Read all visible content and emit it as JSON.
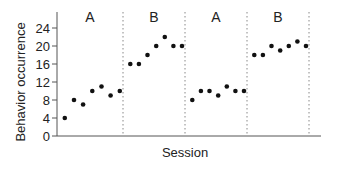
{
  "chart_data": {
    "type": "scatter",
    "title": "",
    "xlabel": "Session",
    "ylabel": "Behavior occurrence",
    "ylim": [
      0,
      24
    ],
    "yticks": [
      0,
      4,
      8,
      12,
      16,
      20,
      24
    ],
    "grid": false,
    "legend": null,
    "phases": [
      {
        "label": "A",
        "values": [
          4,
          8,
          7,
          10,
          11,
          9,
          10
        ]
      },
      {
        "label": "B",
        "values": [
          16,
          16,
          18,
          20,
          22,
          20,
          20
        ]
      },
      {
        "label": "A",
        "values": [
          8,
          10,
          10,
          9,
          11,
          10,
          10
        ]
      },
      {
        "label": "B",
        "values": [
          18,
          18,
          20,
          19,
          20,
          21,
          20
        ]
      }
    ],
    "x": [
      1,
      2,
      3,
      4,
      5,
      6,
      7,
      8,
      9,
      10,
      11,
      12,
      13,
      14,
      15,
      16,
      17,
      18,
      19,
      20,
      21,
      22,
      23,
      24,
      25,
      26,
      27,
      28
    ],
    "series": [
      {
        "name": "Behavior occurrence",
        "values": [
          4,
          8,
          7,
          10,
          11,
          9,
          10,
          16,
          16,
          18,
          20,
          22,
          20,
          20,
          8,
          10,
          10,
          9,
          11,
          10,
          10,
          18,
          18,
          20,
          19,
          20,
          21,
          20
        ]
      }
    ],
    "phase_change_lines_after_session": [
      7,
      14,
      21,
      28
    ]
  },
  "colors": {
    "axis": "#555555",
    "points": "#111111",
    "phase_line": "#888888"
  }
}
